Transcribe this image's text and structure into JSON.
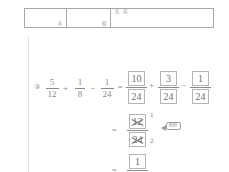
{
  "worksheet": {
    "header": {
      "year_cell_label": "年",
      "class_cell_label": "組",
      "name_cell_label": "名 前"
    },
    "problem": {
      "number_label": "③",
      "equals_1": "=",
      "equals_2": "=",
      "equals_3": "=",
      "plus": "+",
      "minus": "−",
      "reduce_callout_label": "約分",
      "given": [
        {
          "numerator": "5",
          "denominator": "12"
        },
        {
          "numerator": "1",
          "denominator": "8"
        },
        {
          "numerator": "1",
          "denominator": "24"
        }
      ],
      "step1": [
        {
          "numerator": "10",
          "denominator": "24"
        },
        {
          "numerator": "3",
          "denominator": "24"
        },
        {
          "numerator": "1",
          "denominator": "24"
        }
      ],
      "step2": {
        "numerator": "12",
        "denominator": "24",
        "numerator_reduced": "1",
        "denominator_reduced": "2"
      },
      "answer": {
        "numerator": "1",
        "denominator": "2"
      }
    },
    "colors": {
      "ink": "#8a8a8a",
      "box_border": "#b5b5b5",
      "table_border": "#a8a8a8",
      "margin_rule": "#e2e2e2"
    }
  }
}
